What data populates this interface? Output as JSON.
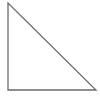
{
  "figure": {
    "name": "right-triangle",
    "shape_type": "triangle",
    "variant": "right-triangle",
    "orientation": "right-angle-at-bottom-left",
    "fill": "none",
    "fill_color": "#ffffff",
    "stroke_color": "#6b6b6b",
    "stroke_width": 1.3,
    "background_color": "#ffffff",
    "canvas": {
      "width": 100,
      "height": 96
    },
    "vertices": [
      {
        "label": "apex-top-left",
        "x": 8,
        "y": 3
      },
      {
        "label": "right-angle-bottom-left",
        "x": 8,
        "y": 90
      },
      {
        "label": "bottom-right",
        "x": 96,
        "y": 90
      }
    ],
    "edges": [
      {
        "label": "vertical-leg",
        "from": "apex-top-left",
        "to": "right-angle-bottom-left",
        "length_px": 87
      },
      {
        "label": "horizontal-leg",
        "from": "right-angle-bottom-left",
        "to": "bottom-right",
        "length_px": 88
      },
      {
        "label": "hypotenuse",
        "from": "bottom-right",
        "to": "apex-top-left",
        "length_px": 124
      }
    ],
    "points_path": "8,3 8,90 96,90 8,3",
    "labels": [],
    "annotations": []
  }
}
